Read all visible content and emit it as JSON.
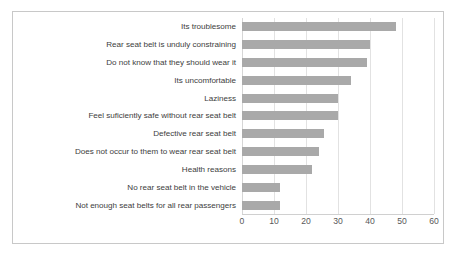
{
  "chart_data": {
    "type": "bar",
    "orientation": "horizontal",
    "title": "",
    "xlabel": "",
    "ylabel": "",
    "xlim": [
      0,
      60
    ],
    "xticks": [
      0,
      10,
      20,
      30,
      40,
      50,
      60
    ],
    "grid": true,
    "legend": false,
    "bar_color": "#a9a9a9",
    "categories": [
      "Its troublesome",
      "Rear seat belt is unduly constraining",
      "Do not know that they should wear it",
      "Its uncomfortable",
      "Laziness",
      "Feel suficiently safe without rear seat belt",
      "Defective rear seat belt",
      "Does not occur to them to wear rear seat belt",
      "Health reasons",
      "No rear seat belt in the vehicle",
      "Not enough seat belts for all rear passengers"
    ],
    "values": [
      48,
      40,
      39,
      34,
      30,
      30,
      25.5,
      24,
      22,
      12,
      12
    ]
  }
}
